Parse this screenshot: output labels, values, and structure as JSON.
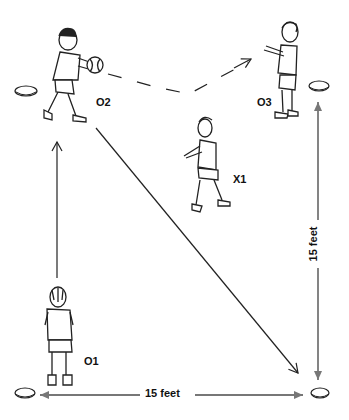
{
  "diagram": {
    "type": "basketball passing drill",
    "players": [
      {
        "id": "O2",
        "label": "O2",
        "role": "passer with ball",
        "position": "top-left"
      },
      {
        "id": "O3",
        "label": "O3",
        "role": "receiver",
        "position": "top-right"
      },
      {
        "id": "X1",
        "label": "X1",
        "role": "defender",
        "position": "center"
      },
      {
        "id": "O1",
        "label": "O1",
        "role": "player",
        "position": "bottom-left"
      }
    ],
    "cones": [
      {
        "position": "top-left"
      },
      {
        "position": "top-right"
      },
      {
        "position": "bottom-left"
      },
      {
        "position": "bottom-right"
      }
    ],
    "paths": [
      {
        "from": "O1",
        "to": "O2",
        "style": "solid",
        "meaning": "cut"
      },
      {
        "from": "O2",
        "to": "O3",
        "style": "dashed",
        "meaning": "pass"
      },
      {
        "from": "O2",
        "to": "bottom-right cone",
        "style": "solid",
        "meaning": "cut"
      }
    ],
    "dimensions": {
      "horizontal": "15 feet",
      "vertical": "15 feet"
    }
  }
}
